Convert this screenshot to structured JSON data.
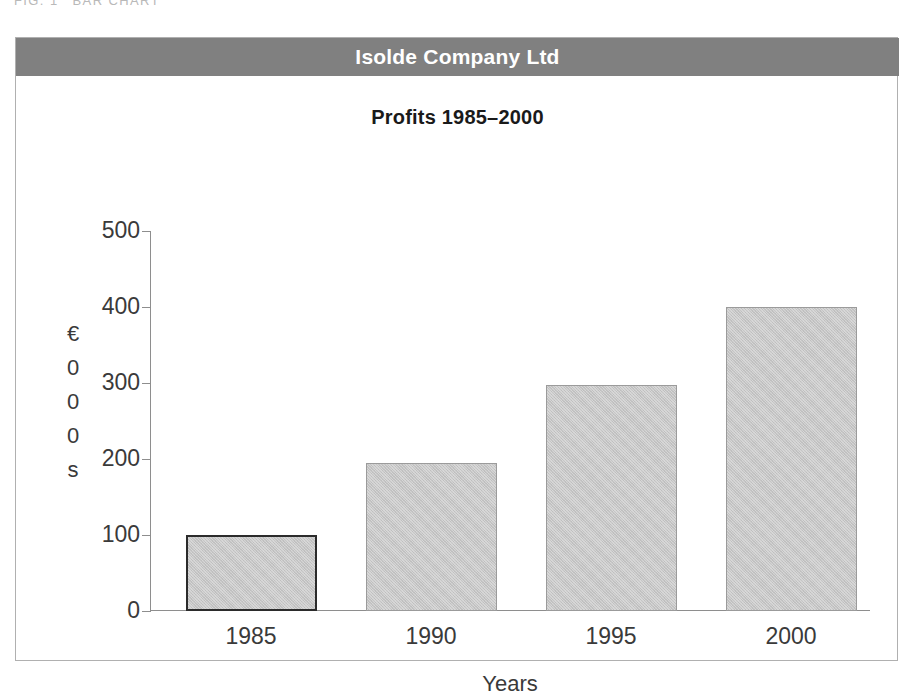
{
  "figure": {
    "caption_number": "FIG. 1",
    "caption_text": "BAR CHART"
  },
  "panel": {
    "company_name": "Isolde Company Ltd",
    "header_color": "#808080"
  },
  "chart_data": {
    "type": "bar",
    "title": "Profits 1985–2000",
    "categories": [
      "1985",
      "1990",
      "1995",
      "2000"
    ],
    "values": [
      100,
      195,
      298,
      400
    ],
    "xlabel": "Years",
    "ylabel": "€000s",
    "ylabel_chars": [
      "€",
      "0",
      "0",
      "0",
      "s"
    ],
    "ylim": [
      0,
      500
    ],
    "ytick_labels": [
      "0",
      "100",
      "200",
      "300",
      "400",
      "500"
    ],
    "ytick_values": [
      0,
      100,
      200,
      300,
      400,
      500
    ],
    "grid": false,
    "legend": null,
    "bar_fill_color": "#c6c6c6",
    "bar_border_color": "#9b9b9b",
    "highlighted_bar_index": 0,
    "highlighted_bar_border_color": "#2b2b2b"
  }
}
